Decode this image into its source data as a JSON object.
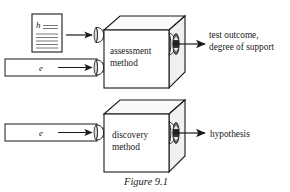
{
  "figure": {
    "caption": "Figure 9.1",
    "rows": [
      {
        "id": "assessment",
        "box_label_line1": "assessment",
        "box_label_line2": "method",
        "inputs": [
          {
            "kind": "document",
            "label": "h",
            "doc_lines": 5
          },
          {
            "kind": "bar",
            "label": "e"
          }
        ],
        "output_line1": "test outcome,",
        "output_line2": "degree of support"
      },
      {
        "id": "discovery",
        "box_label_line1": "discovery",
        "box_label_line2": "method",
        "inputs": [
          {
            "kind": "bar",
            "label": "e"
          }
        ],
        "output_line1": "hypothesis",
        "output_line2": ""
      }
    ],
    "icons": {
      "input_port": "funnel-icon",
      "output_port": "funnel-icon",
      "flow": "arrow-right-icon",
      "document": "document-icon",
      "box": "cube-icon"
    },
    "colors": {
      "ink": "#1a1a1a",
      "paper": "#ffffff",
      "shade": "#d9d9d9",
      "rule": "#555555"
    }
  }
}
